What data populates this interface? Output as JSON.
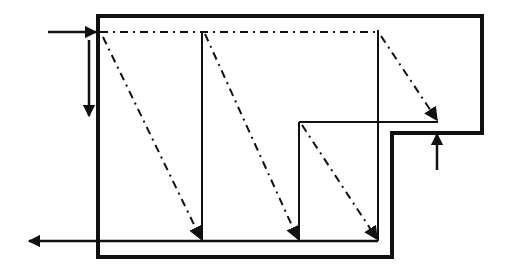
{
  "diagram": {
    "type": "flow-path-schematic",
    "width": 508,
    "height": 274,
    "colors": {
      "background": "#ffffff",
      "stroke": "#111111"
    },
    "outline": {
      "points": "98,16 482,16 482,133 392,133 392,257 98,257",
      "stroke_width": 4
    },
    "top_dashdot_line": {
      "x1": 100,
      "y1": 32,
      "x2": 378,
      "y2": 32
    },
    "solid_lines": [
      {
        "id": "riser-1",
        "x1": 202,
        "y1": 32,
        "x2": 202,
        "y2": 241
      },
      {
        "id": "riser-2",
        "x1": 378,
        "y1": 30,
        "x2": 378,
        "y2": 241
      },
      {
        "id": "riser-3",
        "x1": 299,
        "y1": 122,
        "x2": 299,
        "y2": 241
      },
      {
        "id": "ledge",
        "x1": 299,
        "y1": 122,
        "x2": 438,
        "y2": 122
      },
      {
        "id": "bottom-return",
        "x1": 40,
        "y1": 241,
        "x2": 378,
        "y2": 241
      }
    ],
    "dashdot_diagonals": [
      {
        "id": "diag-1",
        "x1": 103,
        "y1": 37,
        "x2": 201,
        "y2": 239
      },
      {
        "id": "diag-2",
        "x1": 205,
        "y1": 34,
        "x2": 298,
        "y2": 239
      },
      {
        "id": "diag-3",
        "x1": 381,
        "y1": 36,
        "x2": 437,
        "y2": 120
      },
      {
        "id": "diag-4",
        "x1": 302,
        "y1": 125,
        "x2": 377,
        "y2": 239
      }
    ],
    "arrows": [
      {
        "id": "inlet-arrow",
        "direction": "right",
        "x1": 48,
        "y1": 32,
        "x2": 96,
        "y2": 32
      },
      {
        "id": "down-arrow",
        "direction": "down",
        "x1": 89,
        "y1": 40,
        "x2": 89,
        "y2": 116
      },
      {
        "id": "up-arrow",
        "direction": "up",
        "x1": 437,
        "y1": 170,
        "x2": 437,
        "y2": 134
      },
      {
        "id": "outlet-arrow",
        "direction": "left",
        "x1": 378,
        "y1": 241,
        "x2": 29,
        "y2": 241
      }
    ]
  }
}
